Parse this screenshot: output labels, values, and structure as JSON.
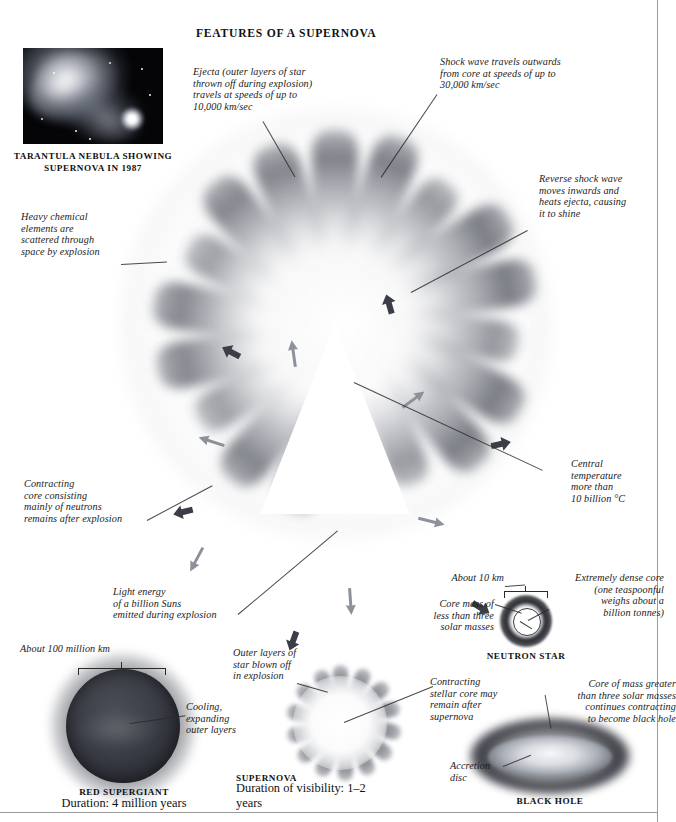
{
  "page": {
    "title": "FEATURES OF A SUPERNOVA"
  },
  "photo": {
    "caption_line1": "TARANTULA NEBULA SHOWING",
    "caption_line2": "SUPERNOVA IN 1987",
    "alt": "tarantula-nebula-photograph"
  },
  "annotations": {
    "ejecta": "Ejecta (outer layers of star\nthrown off during explosion)\ntravels at speeds of up to\n10,000 km/sec",
    "shock_wave": "Shock wave travels outwards\nfrom core at speeds of up to\n30,000 km/sec",
    "reverse_shock": "Reverse shock wave\nmoves inwards and\nheats ejecta, causing\nit to shine",
    "heavy_elements": "Heavy chemical\nelements are\nscattered through\nspace by explosion",
    "contracting_core": "Contracting\ncore consisting\nmainly of neutrons\nremains after explosion",
    "light_energy": "Light energy\nof a billion Suns\nemitted during explosion",
    "central_temperature": "Central\ntemperature\nmore than\n10 billion °C"
  },
  "neutron_star": {
    "about_10_km": "About 10 km",
    "core_mass": "Core mass of\nless than three\nsolar masses",
    "dense_core": "Extremely dense core\n(one teaspoonful\nweighs about a\nbillion tonnes)",
    "caption": "NEUTRON STAR"
  },
  "red_supergiant": {
    "scale": "About 100 million km",
    "cooling": "Cooling,\nexpanding\nouter layers",
    "caption": "RED SUPERGIANT",
    "duration": "Duration: 4 million years"
  },
  "supernova_stage": {
    "outer_layers": "Outer layers of\nstar blown off\nin explosion",
    "contracting_stellar_core": "Contracting\nstellar core may\nremain after\nsupernova",
    "caption": "SUPERNOVA",
    "duration": "Duration of\nvisibility: 1–2 years"
  },
  "black_hole": {
    "core_mass": "Core of mass greater\nthan three solar masses\ncontinues contracting\nto become black hole",
    "accretion_disc": "Accretion\ndisc",
    "caption": "BLACK HOLE"
  },
  "colors": {
    "ink": "#1b1b1b",
    "rule": "#9a9a9a",
    "arrow_outward": "#3b3e46",
    "arrow_inward": "#8d919a"
  }
}
